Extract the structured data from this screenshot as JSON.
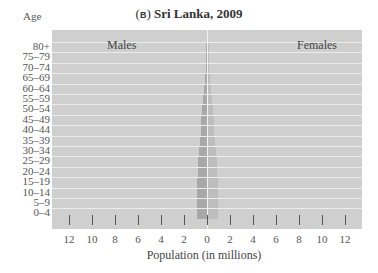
{
  "header": {
    "panel_tag": "B",
    "title": "Sri Lanka, 2009",
    "y_axis_title": "Age"
  },
  "labels": {
    "left": "Males",
    "right": "Females"
  },
  "axis": {
    "xlabel": "Population (in millions)",
    "ticks": [
      "12",
      "10",
      "8",
      "6",
      "4",
      "2",
      "0",
      "2",
      "4",
      "6",
      "8",
      "10",
      "12"
    ]
  },
  "chart_data": {
    "type": "bar",
    "subtype": "population-pyramid",
    "title": "(B) Sri Lanka, 2009",
    "xlabel": "Population (in millions)",
    "ylabel": "Age",
    "xlim": [
      -12,
      12
    ],
    "categories": [
      "80+",
      "75–79",
      "70–74",
      "65–69",
      "60–64",
      "55–59",
      "50–54",
      "45–49",
      "40–44",
      "35–39",
      "30–34",
      "25–29",
      "20–24",
      "15–19",
      "10–14",
      "5–9",
      "0–4"
    ],
    "series": [
      {
        "name": "Males",
        "side": "left",
        "values": [
          0.05,
          0.08,
          0.12,
          0.18,
          0.25,
          0.32,
          0.4,
          0.48,
          0.55,
          0.62,
          0.7,
          0.75,
          0.8,
          0.85,
          0.86,
          0.86,
          0.87
        ]
      },
      {
        "name": "Females",
        "side": "right",
        "values": [
          0.06,
          0.09,
          0.13,
          0.19,
          0.26,
          0.33,
          0.41,
          0.49,
          0.56,
          0.64,
          0.72,
          0.77,
          0.8,
          0.83,
          0.84,
          0.84,
          0.85
        ]
      }
    ],
    "legend": [
      "Males",
      "Females"
    ],
    "grid": true
  }
}
